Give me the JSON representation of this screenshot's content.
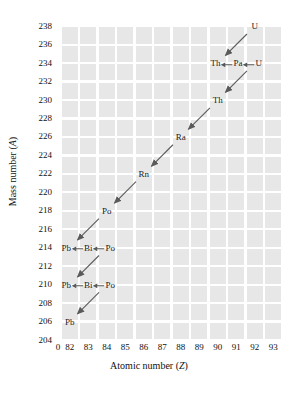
{
  "chart_data": {
    "type": "scatter",
    "title": "",
    "xlabel": "Atomic number (Z)",
    "ylabel": "Mass number (A)",
    "xlim": [
      81.2,
      93.8
    ],
    "ylim": [
      204,
      239
    ],
    "grid": true,
    "legend": null,
    "xtick_labels": [
      "0",
      "82",
      "83",
      "84",
      "85",
      "86",
      "87",
      "88",
      "89",
      "90",
      "91",
      "92",
      "93"
    ],
    "xtick_values": [
      0,
      82,
      83,
      84,
      85,
      86,
      87,
      88,
      89,
      90,
      91,
      92,
      93
    ],
    "ytick_labels": [
      "204",
      "206",
      "208",
      "210",
      "212",
      "214",
      "216",
      "218",
      "220",
      "222",
      "224",
      "226",
      "228",
      "230",
      "232",
      "234",
      "236",
      "238"
    ],
    "ytick_values": [
      204,
      206,
      208,
      210,
      212,
      214,
      216,
      218,
      220,
      222,
      224,
      226,
      228,
      230,
      232,
      234,
      236,
      238
    ],
    "nuclides": [
      {
        "label": "U",
        "z": 92,
        "a": 238
      },
      {
        "label": "Th",
        "z": 90,
        "a": 234
      },
      {
        "label": "Pa",
        "z": 91,
        "a": 234
      },
      {
        "label": "U",
        "z": 92,
        "a": 234
      },
      {
        "label": "Th",
        "z": 90,
        "a": 230
      },
      {
        "label": "Ra",
        "z": 88,
        "a": 226
      },
      {
        "label": "Rn",
        "z": 86,
        "a": 222
      },
      {
        "label": "Po",
        "z": 84,
        "a": 218
      },
      {
        "label": "Pb",
        "z": 82,
        "a": 214
      },
      {
        "label": "Bi",
        "z": 83,
        "a": 214
      },
      {
        "label": "Po",
        "z": 84,
        "a": 214
      },
      {
        "label": "Pb",
        "z": 82,
        "a": 210
      },
      {
        "label": "Bi",
        "z": 83,
        "a": 210
      },
      {
        "label": "Po",
        "z": 84,
        "a": 210
      },
      {
        "label": "Pb",
        "z": 82,
        "a": 206
      }
    ],
    "alpha_decays": [
      {
        "from_z": 92,
        "from_a": 238,
        "to_z": 90,
        "to_a": 234
      },
      {
        "from_z": 92,
        "from_a": 234,
        "to_z": 90,
        "to_a": 230
      },
      {
        "from_z": 90,
        "from_a": 230,
        "to_z": 88,
        "to_a": 226
      },
      {
        "from_z": 88,
        "from_a": 226,
        "to_z": 86,
        "to_a": 222
      },
      {
        "from_z": 86,
        "from_a": 222,
        "to_z": 84,
        "to_a": 218
      },
      {
        "from_z": 84,
        "from_a": 218,
        "to_z": 82,
        "to_a": 214
      },
      {
        "from_z": 84,
        "from_a": 214,
        "to_z": 82,
        "to_a": 210
      },
      {
        "from_z": 84,
        "from_a": 210,
        "to_z": 82,
        "to_a": 206
      }
    ],
    "beta_decays": [
      {
        "from_z": 90,
        "from_a": 234,
        "to_z": 91,
        "to_a": 234
      },
      {
        "from_z": 91,
        "from_a": 234,
        "to_z": 92,
        "to_a": 234
      },
      {
        "from_z": 82,
        "from_a": 214,
        "to_z": 83,
        "to_a": 214
      },
      {
        "from_z": 83,
        "from_a": 214,
        "to_z": 84,
        "to_a": 214
      },
      {
        "from_z": 82,
        "from_a": 210,
        "to_z": 83,
        "to_a": 210
      },
      {
        "from_z": 83,
        "from_a": 210,
        "to_z": 84,
        "to_a": 210
      }
    ],
    "node_rows": [
      {
        "row_id": "row-u238",
        "a": 238,
        "center_z": 92,
        "items": [
          "U"
        ]
      },
      {
        "row_id": "row-a234",
        "a": 234,
        "center_z": 91,
        "items": [
          "Th",
          "Pa",
          "U"
        ]
      },
      {
        "row_id": "row-th230",
        "a": 230,
        "center_z": 90,
        "items": [
          "Th"
        ]
      },
      {
        "row_id": "row-ra226",
        "a": 226,
        "center_z": 88,
        "items": [
          "Ra"
        ]
      },
      {
        "row_id": "row-rn222",
        "a": 222,
        "center_z": 86,
        "items": [
          "Rn"
        ]
      },
      {
        "row_id": "row-po218",
        "a": 218,
        "center_z": 84,
        "items": [
          "Po"
        ]
      },
      {
        "row_id": "row-a214",
        "a": 214,
        "center_z": 83,
        "items": [
          "Pb",
          "Bi",
          "Po"
        ]
      },
      {
        "row_id": "row-a210",
        "a": 210,
        "center_z": 83,
        "items": [
          "Pb",
          "Bi",
          "Po"
        ]
      },
      {
        "row_id": "row-pb206",
        "a": 206,
        "center_z": 82,
        "items": [
          "Pb"
        ]
      }
    ]
  },
  "axes": {
    "x_title_text": "Atomic number (",
    "x_title_symbol": "Z",
    "x_title_tail": ")",
    "y_title_text": "Mass number (",
    "y_title_symbol": "A",
    "y_title_tail": ")"
  },
  "colors": {
    "cell_fill": "#e7e7e7",
    "gridline": "#ffffff",
    "arrow": "#5a5a5a",
    "text": "#1a1a1a",
    "background": "#ffffff"
  }
}
